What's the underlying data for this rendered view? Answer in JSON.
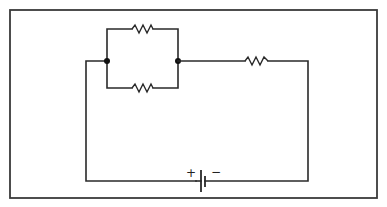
{
  "diagram": {
    "type": "circuit-schematic",
    "components": [
      {
        "id": "R1",
        "kind": "resistor",
        "role": "parallel-branch-top"
      },
      {
        "id": "R2",
        "kind": "resistor",
        "role": "parallel-branch-bottom"
      },
      {
        "id": "R3",
        "kind": "resistor",
        "role": "series"
      },
      {
        "id": "B1",
        "kind": "battery",
        "role": "source"
      }
    ],
    "battery": {
      "positive_label": "+",
      "negative_label": "−"
    },
    "nodes": [
      {
        "id": "N1",
        "label": "left-junction"
      },
      {
        "id": "N2",
        "label": "right-junction"
      }
    ],
    "colors": {
      "line": "#2a2a2a",
      "background": "#ffffff"
    }
  }
}
